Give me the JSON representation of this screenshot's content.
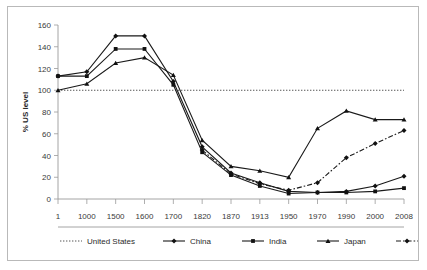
{
  "chart_data": {
    "type": "line",
    "title": "",
    "xlabel": "",
    "ylabel": "% US level",
    "ylim": [
      0,
      160
    ],
    "yticks": [
      0,
      20,
      40,
      60,
      80,
      100,
      120,
      140,
      160
    ],
    "grid": false,
    "legend_position": "bottom",
    "categories": [
      "1",
      "1000",
      "1500",
      "1600",
      "1700",
      "1820",
      "1870",
      "1913",
      "1950",
      "1970",
      "1990",
      "2000",
      "2008"
    ],
    "series": [
      {
        "name": "United States",
        "marker": "none",
        "line_style": "dotted",
        "color": "#555555",
        "values": [
          100,
          100,
          100,
          100,
          100,
          100,
          100,
          100,
          100,
          100,
          100,
          100,
          100
        ]
      },
      {
        "name": "China",
        "marker": "diamond",
        "line_style": "solid",
        "color": "#1a1a1a",
        "values": [
          113,
          117,
          150,
          150,
          108,
          48,
          24,
          15,
          7,
          6,
          7,
          12,
          21
        ]
      },
      {
        "name": "India",
        "marker": "square",
        "line_style": "solid",
        "color": "#1a1a1a",
        "values": [
          113,
          113,
          138,
          138,
          105,
          43,
          22,
          12,
          5,
          6,
          6,
          7,
          10
        ]
      },
      {
        "name": "Japan",
        "marker": "triangle",
        "line_style": "solid",
        "color": "#1a1a1a",
        "values": [
          100,
          106,
          125,
          130,
          114,
          54,
          30,
          26,
          20,
          65,
          81,
          73,
          73
        ]
      },
      {
        "name": "South Korea",
        "marker": "diamond",
        "line_style": "dashdot",
        "color": "#1a1a1a",
        "values": [
          null,
          null,
          null,
          null,
          null,
          45,
          23,
          14,
          8,
          15,
          38,
          51,
          63
        ]
      }
    ]
  },
  "legend": {
    "entries": [
      {
        "label": "United States"
      },
      {
        "label": "China"
      },
      {
        "label": "India"
      },
      {
        "label": "Japan"
      },
      {
        "label": "South Korea"
      }
    ]
  }
}
